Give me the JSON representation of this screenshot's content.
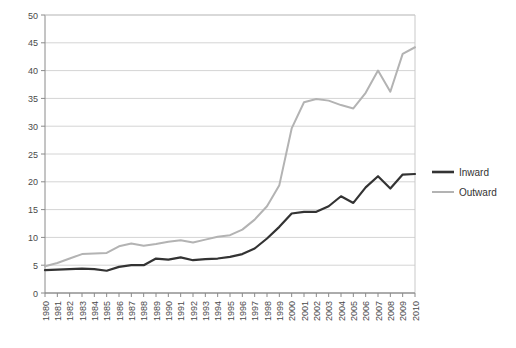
{
  "chart_data": {
    "type": "line",
    "title": "",
    "subtitle": "",
    "xlabel": "",
    "ylabel": "",
    "xlim": [
      1980,
      2010
    ],
    "ylim": [
      0,
      50
    ],
    "ytick_step": 5,
    "grid": true,
    "grid_axis": "y",
    "legend_position": "right",
    "categories": [
      "1980",
      "1981",
      "1982",
      "1983",
      "1984",
      "1985",
      "1986",
      "1987",
      "1988",
      "1989",
      "1990",
      "1991",
      "1992",
      "1993",
      "1994",
      "1995",
      "1996",
      "1997",
      "1998",
      "1999",
      "2000",
      "2001",
      "2002",
      "2003",
      "2004",
      "2005",
      "2006",
      "2007",
      "2008",
      "2009",
      "2010"
    ],
    "yticks": [
      0,
      5,
      10,
      15,
      20,
      25,
      30,
      35,
      40,
      45,
      50
    ],
    "series": [
      {
        "name": "Inward",
        "color": "#333333",
        "width": 2.2,
        "values": [
          4.1,
          4.2,
          4.3,
          4.4,
          4.3,
          4.0,
          4.7,
          5.0,
          5.0,
          6.2,
          6.0,
          6.4,
          5.9,
          6.1,
          6.2,
          6.5,
          7.0,
          8.0,
          9.8,
          11.9,
          14.3,
          14.6,
          14.6,
          15.6,
          17.4,
          16.2,
          19.0,
          21.0,
          18.8,
          21.3,
          21.4
        ]
      },
      {
        "name": "Outward",
        "color": "#b3b3b3",
        "width": 2.0,
        "values": [
          4.8,
          5.4,
          6.2,
          7.0,
          7.1,
          7.2,
          8.4,
          8.9,
          8.5,
          8.8,
          9.2,
          9.5,
          9.1,
          9.6,
          10.1,
          10.4,
          11.4,
          13.2,
          15.6,
          19.4,
          29.6,
          34.3,
          34.9,
          34.6,
          33.8,
          33.2,
          36.0,
          40.0,
          36.2,
          43.0,
          44.2
        ]
      }
    ]
  },
  "legend": {
    "items": [
      {
        "label": "Inward",
        "color": "#333333"
      },
      {
        "label": "Outward",
        "color": "#b3b3b3"
      }
    ]
  }
}
